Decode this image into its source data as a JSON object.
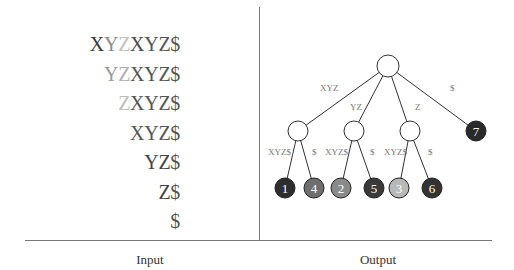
{
  "captions": {
    "input": "Input",
    "output": "Output"
  },
  "input": {
    "suffixes": [
      {
        "chars": [
          {
            "c": "X",
            "color": "#3a3a3a"
          },
          {
            "c": "Y",
            "color": "#8a8a8a"
          },
          {
            "c": "Z",
            "color": "#c0c0c0"
          },
          {
            "c": "X",
            "color": "#4a4a4a"
          },
          {
            "c": "Y",
            "color": "#555555"
          },
          {
            "c": "Z",
            "color": "#555555"
          },
          {
            "c": "$",
            "color": "#555555"
          }
        ]
      },
      {
        "chars": [
          {
            "c": "Y",
            "color": "#9a9a9a"
          },
          {
            "c": "Z",
            "color": "#b0b0b0"
          },
          {
            "c": "X",
            "color": "#555555"
          },
          {
            "c": "Y",
            "color": "#555555"
          },
          {
            "c": "Z",
            "color": "#555555"
          },
          {
            "c": "$",
            "color": "#555555"
          }
        ]
      },
      {
        "chars": [
          {
            "c": "Z",
            "color": "#bdbdbd"
          },
          {
            "c": "X",
            "color": "#555555"
          },
          {
            "c": "Y",
            "color": "#555555"
          },
          {
            "c": "Z",
            "color": "#555555"
          },
          {
            "c": "$",
            "color": "#555555"
          }
        ]
      },
      {
        "chars": [
          {
            "c": "X",
            "color": "#555555"
          },
          {
            "c": "Y",
            "color": "#555555"
          },
          {
            "c": "Z",
            "color": "#555555"
          },
          {
            "c": "$",
            "color": "#555555"
          }
        ]
      },
      {
        "chars": [
          {
            "c": "Y",
            "color": "#444444"
          },
          {
            "c": "Z",
            "color": "#444444"
          },
          {
            "c": "$",
            "color": "#555555"
          }
        ]
      },
      {
        "chars": [
          {
            "c": "Z",
            "color": "#444444"
          },
          {
            "c": "$",
            "color": "#555555"
          }
        ]
      },
      {
        "chars": [
          {
            "c": "$",
            "color": "#555555"
          }
        ]
      }
    ]
  },
  "tree": {
    "root": {
      "x": 388,
      "y": 66,
      "r": 11
    },
    "internal": [
      {
        "id": "n1",
        "x": 298,
        "y": 131,
        "r": 10,
        "edge_label": "XYZ",
        "label_x": 320,
        "label_y": 91
      },
      {
        "id": "n2",
        "x": 354,
        "y": 131,
        "r": 10,
        "edge_label": "YZ",
        "label_x": 350,
        "label_y": 110
      },
      {
        "id": "n3",
        "x": 410,
        "y": 131,
        "r": 10,
        "edge_label": "Z",
        "label_x": 415,
        "label_y": 110
      }
    ],
    "leaves": [
      {
        "label": "1",
        "x": 285,
        "y": 188,
        "color": "#2e2e2e",
        "parent": "n1",
        "edge_label": "XYZ$",
        "label_x": 268,
        "label_y": 155
      },
      {
        "label": "4",
        "x": 314,
        "y": 188,
        "color": "#6e6e6e",
        "parent": "n1",
        "edge_label": "$",
        "label_x": 312,
        "label_y": 155
      },
      {
        "label": "2",
        "x": 341,
        "y": 188,
        "color": "#8a8a8a",
        "parent": "n2",
        "edge_label": "XYZ$",
        "label_x": 325,
        "label_y": 155
      },
      {
        "label": "5",
        "x": 374,
        "y": 188,
        "color": "#3a3a3a",
        "parent": "n2",
        "edge_label": "$",
        "label_x": 370,
        "label_y": 155
      },
      {
        "label": "3",
        "x": 399,
        "y": 188,
        "color": "#b8b8b8",
        "parent": "n3",
        "edge_label": "XYZ$",
        "label_x": 384,
        "label_y": 155
      },
      {
        "label": "6",
        "x": 432,
        "y": 188,
        "color": "#333333",
        "parent": "n3",
        "edge_label": "$",
        "label_x": 428,
        "label_y": 155
      },
      {
        "label": "7",
        "x": 476,
        "y": 131,
        "color": "#2a2a2a",
        "parent": "root",
        "edge_label": "$",
        "label_x": 450,
        "label_y": 91
      }
    ]
  }
}
